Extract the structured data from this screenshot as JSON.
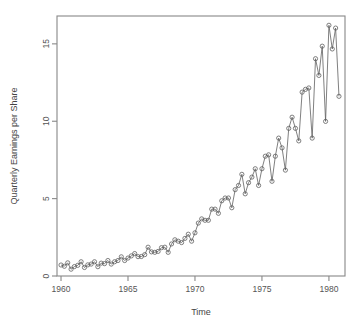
{
  "chart_data": {
    "type": "line",
    "title": "",
    "subtitle": "",
    "xlabel": "Time",
    "ylabel": "Quarterly Earnings per Share",
    "xlim": [
      1959.7,
      1981.2
    ],
    "ylim": [
      0.0,
      16.8
    ],
    "xticks": [
      1960,
      1965,
      1970,
      1975,
      1980
    ],
    "xtick_labels": [
      "1960",
      "1965",
      "1970",
      "1975",
      "1980"
    ],
    "yticks": [
      0,
      5,
      10,
      15
    ],
    "ytick_labels": [
      "0",
      "5",
      "10",
      "15"
    ],
    "grid": false,
    "legend": null,
    "legend_position": "none",
    "frame": "box",
    "series_name": "Quarterly Earnings per Share",
    "marker": "open-circle",
    "line_color": "#606060",
    "marker_color": "#606060",
    "frequency": "quarterly",
    "x": [
      1960.0,
      1960.25,
      1960.5,
      1960.75,
      1961.0,
      1961.25,
      1961.5,
      1961.75,
      1962.0,
      1962.25,
      1962.5,
      1962.75,
      1963.0,
      1963.25,
      1963.5,
      1963.75,
      1964.0,
      1964.25,
      1964.5,
      1964.75,
      1965.0,
      1965.25,
      1965.5,
      1965.75,
      1966.0,
      1966.25,
      1966.5,
      1966.75,
      1967.0,
      1967.25,
      1967.5,
      1967.75,
      1968.0,
      1968.25,
      1968.5,
      1968.75,
      1969.0,
      1969.25,
      1969.5,
      1969.75,
      1970.0,
      1970.25,
      1970.5,
      1970.75,
      1971.0,
      1971.25,
      1971.5,
      1971.75,
      1972.0,
      1972.25,
      1972.5,
      1972.75,
      1973.0,
      1973.25,
      1973.5,
      1973.75,
      1974.0,
      1974.25,
      1974.5,
      1974.75,
      1975.0,
      1975.25,
      1975.5,
      1975.75,
      1976.0,
      1976.25,
      1976.5,
      1976.75,
      1977.0,
      1977.25,
      1977.5,
      1977.75,
      1978.0,
      1978.25,
      1978.5,
      1978.75,
      1979.0,
      1979.25,
      1979.5,
      1979.75,
      1980.0,
      1980.25,
      1980.5,
      1980.75
    ],
    "values": [
      0.71,
      0.63,
      0.85,
      0.44,
      0.61,
      0.69,
      0.92,
      0.55,
      0.72,
      0.77,
      0.92,
      0.6,
      0.83,
      0.8,
      1.0,
      0.77,
      0.92,
      1.0,
      1.24,
      1.0,
      1.16,
      1.3,
      1.45,
      1.25,
      1.26,
      1.38,
      1.86,
      1.56,
      1.53,
      1.59,
      1.83,
      1.86,
      1.53,
      2.07,
      2.34,
      2.25,
      2.16,
      2.43,
      2.7,
      2.25,
      2.79,
      3.42,
      3.69,
      3.6,
      3.6,
      4.32,
      4.32,
      4.05,
      4.86,
      5.04,
      5.04,
      4.41,
      5.58,
      5.85,
      6.57,
      5.31,
      6.03,
      6.39,
      6.93,
      5.85,
      6.93,
      7.74,
      7.83,
      6.12,
      7.74,
      8.91,
      8.28,
      6.84,
      9.54,
      10.26,
      9.54,
      8.73,
      11.88,
      12.06,
      12.15,
      8.91,
      14.04,
      12.96,
      14.85,
      9.99,
      16.2,
      14.67,
      16.02,
      11.61
    ],
    "annotations": []
  }
}
